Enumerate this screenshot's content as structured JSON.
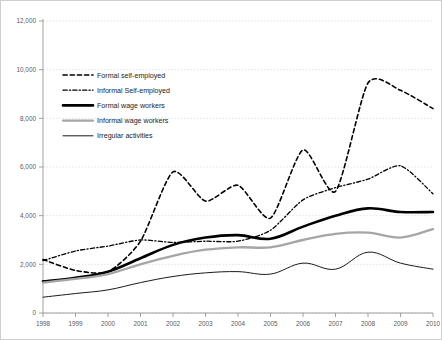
{
  "chart_data": {
    "type": "line",
    "title": "",
    "xlabel": "",
    "ylabel": "",
    "grid": true,
    "legend_position": "inside-upper-left",
    "x": [
      1998,
      1999,
      2000,
      2001,
      2002,
      2003,
      2004,
      2005,
      2006,
      2007,
      2008,
      2009,
      2010
    ],
    "categories": [
      "1998",
      "1999",
      "2000",
      "2001",
      "2002",
      "2003",
      "2004",
      "2005",
      "2006",
      "2007",
      "2008",
      "2009",
      "2010"
    ],
    "xlim": [
      1998,
      2010
    ],
    "ylim": [
      0,
      12000
    ],
    "yticks": [
      0,
      2000,
      4000,
      6000,
      8000,
      10000,
      12000
    ],
    "yticklabels": [
      "0",
      "2,000",
      "4,000",
      "6,000",
      "8,000",
      "10,000",
      "12,000"
    ],
    "series": [
      {
        "name": "Formal self-employed",
        "style": "dashed",
        "color": "#000000",
        "width": 1.6,
        "values": [
          2200,
          1750,
          1700,
          2950,
          5800,
          4600,
          5250,
          3900,
          6700,
          5000,
          9450,
          9150,
          8400
        ]
      },
      {
        "name": "Informal Self-employed",
        "style": "dash-dot",
        "color": "#000000",
        "width": 1.3,
        "values": [
          2150,
          2550,
          2750,
          3000,
          2900,
          2950,
          2950,
          3400,
          4650,
          5150,
          5500,
          6050,
          4900
        ]
      },
      {
        "name": "Formal wage workers",
        "style": "solid-thick",
        "color": "#000000",
        "width": 2.6,
        "values": [
          1300,
          1450,
          1700,
          2250,
          2800,
          3100,
          3200,
          3050,
          3550,
          4000,
          4300,
          4150,
          4150
        ]
      },
      {
        "name": "Informal wage workers",
        "style": "solid-gray",
        "color": "#a6a6a6",
        "width": 2.3,
        "values": [
          1250,
          1400,
          1600,
          2000,
          2350,
          2600,
          2700,
          2700,
          3000,
          3250,
          3300,
          3100,
          3450
        ]
      },
      {
        "name": "Irregular activities",
        "style": "solid-thin",
        "color": "#1a1a1a",
        "width": 1.0,
        "values": [
          650,
          800,
          950,
          1250,
          1500,
          1650,
          1700,
          1600,
          2050,
          1800,
          2500,
          2050,
          1800
        ]
      }
    ]
  },
  "legend": {
    "items": [
      {
        "label": "Formal self-employed"
      },
      {
        "label": "Informal Self-employed"
      },
      {
        "label": "Formal wage workers"
      },
      {
        "label": "Informal wage workers"
      },
      {
        "label": "Irregular activities"
      }
    ]
  },
  "axis": {
    "y_tick_labels": [
      "12,000",
      "10,000",
      "8,000",
      "6,000",
      "4,000",
      "2,000",
      "0"
    ],
    "x_tick_labels": [
      "1998",
      "1999",
      "2000",
      "2001",
      "2002",
      "2003",
      "2004",
      "2005",
      "2006",
      "2007",
      "2008",
      "2009",
      "2010"
    ]
  }
}
